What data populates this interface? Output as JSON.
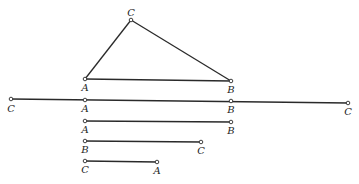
{
  "figure": {
    "colors": {
      "ink": "#2a2a2a",
      "background": "#ffffff"
    },
    "triangle": {
      "vertices": {
        "C": {
          "x": 131,
          "y": 20,
          "label": "C"
        },
        "A": {
          "x": 85,
          "y": 79,
          "label": "A"
        },
        "B": {
          "x": 231,
          "y": 81,
          "label": "B"
        }
      }
    },
    "combined_line": {
      "points": [
        {
          "x": 11,
          "y": 99,
          "label": "C"
        },
        {
          "x": 85,
          "y": 100,
          "label": "A"
        },
        {
          "x": 231,
          "y": 101,
          "label": "B"
        },
        {
          "x": 348,
          "y": 103,
          "label": "C"
        }
      ]
    },
    "segments": [
      {
        "name": "AB",
        "start": {
          "x": 85,
          "y": 121,
          "label": "A"
        },
        "end": {
          "x": 231,
          "y": 122,
          "label": "B"
        }
      },
      {
        "name": "BC",
        "start": {
          "x": 85,
          "y": 141,
          "label": "B"
        },
        "end": {
          "x": 201,
          "y": 142,
          "label": "C"
        }
      },
      {
        "name": "CA",
        "start": {
          "x": 85,
          "y": 161,
          "label": "C"
        },
        "end": {
          "x": 157,
          "y": 162,
          "label": "A"
        }
      }
    ]
  }
}
